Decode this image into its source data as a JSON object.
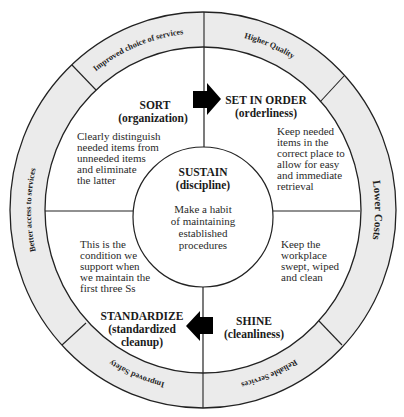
{
  "colors": {
    "background": "#ffffff",
    "ring_fill": "#ebebeb",
    "line": "#222222",
    "arrow": "#000000",
    "text": "#1a1a1a"
  },
  "outer_ring": {
    "segments": [
      {
        "id": "top-left",
        "label": "Improved choice of services"
      },
      {
        "id": "top-right",
        "label": "Higher Quality"
      },
      {
        "id": "right",
        "label": "Lower Costs"
      },
      {
        "id": "bottom-right",
        "label": "Reliable Services"
      },
      {
        "id": "bottom-left",
        "label": "Improved Safety"
      },
      {
        "id": "left",
        "label": "Better access to services"
      }
    ]
  },
  "quadrants": {
    "sort": {
      "title": "SORT",
      "subtitle": "(organization)",
      "description": [
        "Clearly distinguish",
        "needed items from",
        "unneeded items",
        "and eliminate",
        "the latter"
      ]
    },
    "set_in_order": {
      "title": "SET IN ORDER",
      "subtitle": "(orderliness)",
      "description": [
        "Keep needed",
        "items in the",
        "correct place to",
        "allow for easy",
        "and immediate",
        "retrieval"
      ]
    },
    "shine": {
      "title": "SHINE",
      "subtitle": "(cleanliness)",
      "description": [
        "Keep the",
        "workplace",
        "swept, wiped",
        "and clean"
      ]
    },
    "standardize": {
      "title": "STANDARDIZE",
      "subtitle_lines": [
        "(standardized",
        "cleanup)"
      ],
      "description": [
        "This is the",
        "condition we",
        "support when",
        "we maintain the",
        "first three Ss"
      ]
    }
  },
  "center": {
    "title": "SUSTAIN",
    "subtitle": "(discipline)",
    "description": [
      "Make a habit",
      "of maintaining",
      "established",
      "procedures"
    ]
  },
  "arrows": [
    {
      "id": "sort-to-set-in-order",
      "direction": "right"
    },
    {
      "id": "shine-to-standardize",
      "direction": "left"
    }
  ]
}
